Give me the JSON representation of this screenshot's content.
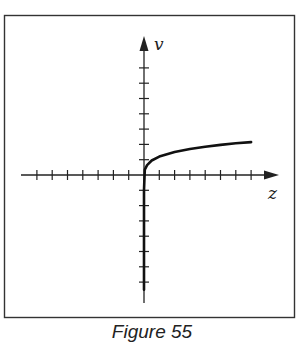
{
  "chart_data": {
    "type": "line",
    "title": "",
    "caption": "Figure 55",
    "xlabel": "z",
    "ylabel": "v",
    "xlim": [
      -7.5,
      8.5
    ],
    "ylim": [
      -8,
      8
    ],
    "x_ticks": [
      -7,
      -6,
      -5,
      -4,
      -3,
      -2,
      -1,
      1,
      2,
      3,
      4,
      5,
      6,
      7
    ],
    "y_ticks": [
      -7,
      -6,
      -5,
      -4,
      -3,
      -2,
      -1,
      1,
      2,
      3,
      4,
      5,
      6,
      7
    ],
    "tick_labels": false,
    "grid": false,
    "legend": null,
    "series": [
      {
        "name": "curve",
        "x": [
          0.0,
          0.0,
          0.05,
          0.2,
          0.5,
          1.0,
          2.0,
          3.0,
          4.0,
          5.0,
          6.0,
          7.0
        ],
        "y": [
          -7.5,
          -1.0,
          0.35,
          0.65,
          0.95,
          1.2,
          1.5,
          1.7,
          1.85,
          1.97,
          2.07,
          2.15
        ]
      }
    ]
  },
  "labels": {
    "x_axis": "z",
    "y_axis": "v",
    "caption": "Figure 55"
  }
}
